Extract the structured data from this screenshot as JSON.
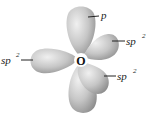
{
  "diagram": {
    "center_atom": "O",
    "colors": {
      "lobe_light": "#e6e6e6",
      "lobe_mid": "#bdbdbd",
      "lobe_dark": "#9a9a9a",
      "text": "#222222",
      "background": "#ffffff"
    },
    "labels": [
      {
        "id": "p_top",
        "base": "p",
        "sup": ""
      },
      {
        "id": "sp2_upper_right",
        "base": "sp",
        "sup": "2"
      },
      {
        "id": "sp2_left",
        "base": "sp",
        "sup": "2"
      },
      {
        "id": "sp2_lower_right",
        "base": "sp",
        "sup": "2"
      }
    ],
    "orbitals": [
      {
        "name": "p orbital (top lobe)",
        "type": "p"
      },
      {
        "name": "p orbital (bottom lobe)",
        "type": "p"
      },
      {
        "name": "sp2 orbital (left)",
        "type": "sp2"
      },
      {
        "name": "sp2 orbital (upper right)",
        "type": "sp2"
      },
      {
        "name": "sp2 orbital (lower right)",
        "type": "sp2"
      }
    ]
  }
}
